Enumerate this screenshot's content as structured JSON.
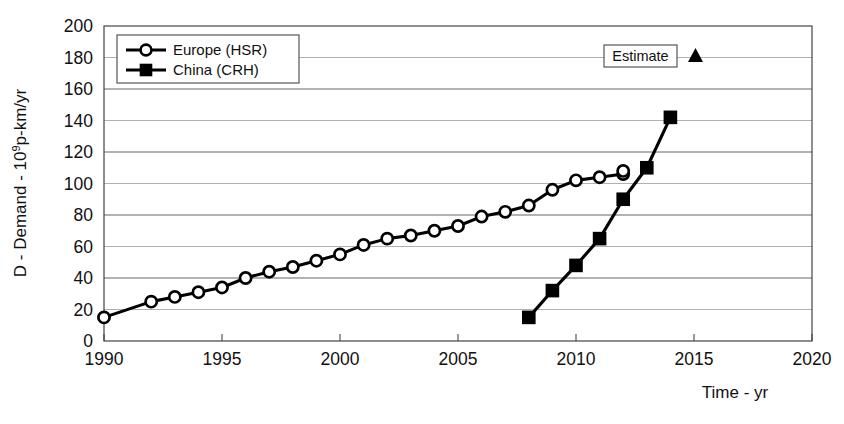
{
  "chart_data": {
    "type": "line",
    "title": "",
    "xlabel": "Time - yr",
    "ylabel": "D - Demand - 10⁹p-km/yr",
    "ylabel_parts": {
      "prefix": "D - Demand - 10",
      "exponent": "9",
      "suffix": "p-km/yr"
    },
    "xlim": [
      1990,
      2020
    ],
    "ylim": [
      0,
      200
    ],
    "xticks": [
      1990,
      1995,
      2000,
      2005,
      2010,
      2015,
      2020
    ],
    "xtick_labels": [
      "1990",
      "1995",
      "2000",
      "2005",
      "2010",
      "2015",
      "2020"
    ],
    "yticks": [
      0,
      20,
      40,
      60,
      80,
      100,
      120,
      140,
      160,
      180,
      200
    ],
    "ytick_labels": [
      "0",
      "20",
      "40",
      "60",
      "80",
      "100",
      "120",
      "140",
      "160",
      "180",
      "200"
    ],
    "grid": "horizontal",
    "legend_position": "top-left",
    "series": [
      {
        "name": "Europe (HSR)",
        "marker": "open-circle",
        "color": "#000000",
        "x": [
          1990,
          1992,
          1993,
          1994,
          1995,
          1996,
          1997,
          1998,
          1999,
          2000,
          2001,
          2002,
          2003,
          2004,
          2005,
          2006,
          2007,
          2008,
          2009,
          2010,
          2011,
          2012
        ],
        "values": [
          15,
          25,
          28,
          31,
          34,
          40,
          44,
          47,
          51,
          55,
          61,
          65,
          67,
          70,
          73,
          79,
          82,
          86,
          96,
          102,
          104,
          106
        ]
      },
      {
        "name": "China (CRH)",
        "marker": "filled-square",
        "color": "#000000",
        "x": [
          2008,
          2009,
          2010,
          2011,
          2012,
          2013,
          2014
        ],
        "values": [
          15,
          32,
          48,
          65,
          90,
          110,
          142
        ]
      }
    ],
    "last_point_europe": {
      "x": 2012,
      "y": 108
    },
    "annotations": [
      {
        "label": "Estimate",
        "marker": "filled-triangle",
        "boxed": true,
        "x": 2014.2,
        "y": 181
      }
    ]
  }
}
